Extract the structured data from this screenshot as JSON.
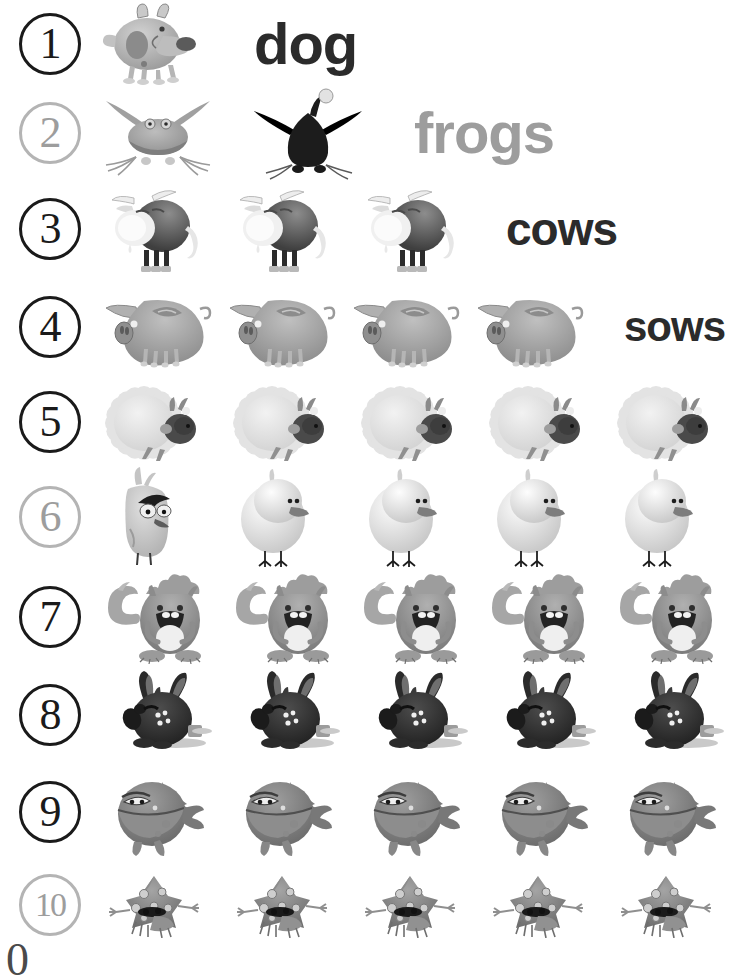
{
  "worksheet": {
    "title": "Counting Animals 1 to 10",
    "background_color": "#ffffff",
    "dark_color": "#2b2b2b",
    "light_color": "#9d9d9d",
    "bottom_clipped_glyph": "0"
  },
  "rows": [
    {
      "number": "1",
      "number_style": "dark",
      "count": 1,
      "animal": "dog",
      "word": "dog",
      "word_style": "dark",
      "word_size": 58,
      "show_word": true
    },
    {
      "number": "2",
      "number_style": "light",
      "count": 2,
      "animal": "frog",
      "word": "frogs",
      "word_style": "light",
      "word_size": 58,
      "show_word": true
    },
    {
      "number": "3",
      "number_style": "dark",
      "count": 3,
      "animal": "cow",
      "word": "cows",
      "word_style": "dark",
      "word_size": 46,
      "show_word": true
    },
    {
      "number": "4",
      "number_style": "dark",
      "count": 4,
      "animal": "sow",
      "word": "sows",
      "word_style": "dark",
      "word_size": 42,
      "show_word": true
    },
    {
      "number": "5",
      "number_style": "dark",
      "count": 5,
      "animal": "sheep",
      "word": "",
      "word_style": "dark",
      "word_size": 40,
      "show_word": false
    },
    {
      "number": "6",
      "number_style": "light",
      "count": 5,
      "animal": "bird",
      "word": "",
      "word_style": "light",
      "word_size": 40,
      "show_word": false
    },
    {
      "number": "7",
      "number_style": "dark",
      "count": 5,
      "animal": "squirrel",
      "word": "",
      "word_style": "dark",
      "word_size": 40,
      "show_word": false
    },
    {
      "number": "8",
      "number_style": "dark",
      "count": 5,
      "animal": "rabbit",
      "word": "",
      "word_style": "dark",
      "word_size": 40,
      "show_word": false
    },
    {
      "number": "9",
      "number_style": "dark",
      "count": 5,
      "animal": "fish",
      "word": "",
      "word_style": "dark",
      "word_size": 40,
      "show_word": false
    },
    {
      "number": "10",
      "number_style": "light",
      "count": 5,
      "animal": "turtle",
      "word": "",
      "word_style": "light",
      "word_size": 40,
      "show_word": false
    }
  ],
  "layout": {
    "row_tops": [
      0,
      85,
      180,
      278,
      375,
      468,
      565,
      668,
      762,
      862
    ],
    "row_heights": [
      88,
      95,
      98,
      97,
      93,
      97,
      103,
      94,
      100,
      85
    ]
  }
}
